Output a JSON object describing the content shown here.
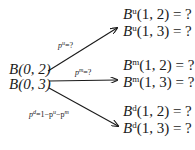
{
  "root": {
    "line1": "B(0, 2)",
    "line2": "B(0, 3)"
  },
  "branches": [
    {
      "label": "p^u=?",
      "label_sym": "p",
      "label_sup": "u",
      "label_rest": "=?",
      "targets": [
        {
          "sym": "B",
          "sup": "u",
          "args": "(1, 2) = ?"
        },
        {
          "sym": "B",
          "sup": "u",
          "args": "(1, 3) = ?"
        }
      ]
    },
    {
      "label": "p^m=?",
      "label_sym": "p",
      "label_sup": "m",
      "label_rest": "=?",
      "targets": [
        {
          "sym": "B",
          "sup": "m",
          "args": "(1, 2) = ?"
        },
        {
          "sym": "B",
          "sup": "m",
          "args": "(1, 3) = ?"
        }
      ]
    },
    {
      "label": "p^d=1−p^u−p^m",
      "label_sym": "p",
      "label_sup": "d",
      "label_rest": "=1−p",
      "label_sup2": "u",
      "label_rest2": "−p",
      "label_sup3": "m",
      "targets": [
        {
          "sym": "B",
          "sup": "d",
          "args": "(1, 2) = ?"
        },
        {
          "sym": "B",
          "sup": "d",
          "args": "(1, 3) = ?"
        }
      ]
    }
  ]
}
